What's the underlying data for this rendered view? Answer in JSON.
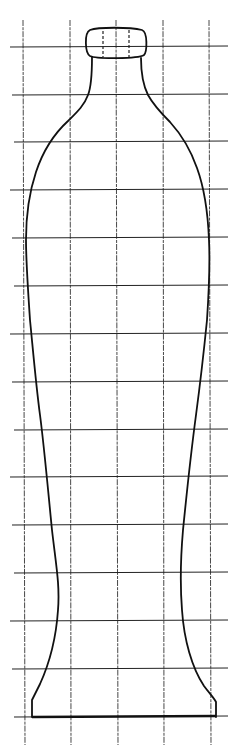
{
  "diagram": {
    "colors": {
      "background": "#ffffff",
      "line": "#111111",
      "grid": "#222222"
    },
    "grid": {
      "vertical_x": [
        23,
        70,
        116,
        163,
        209
      ],
      "vertical_y_range": [
        20,
        745
      ],
      "horizontal_y": [
        47,
        95,
        142,
        190,
        238,
        286,
        334,
        382,
        430,
        477,
        525,
        573,
        621,
        669,
        717
      ],
      "horizontal_x_range": [
        10,
        228
      ]
    },
    "stopper": {
      "x": 86,
      "y": 28,
      "width": 59,
      "height": 30,
      "dash_x": [
        103,
        129
      ]
    },
    "base": {
      "y": 717,
      "x_left": 32,
      "x_right": 216
    }
  }
}
